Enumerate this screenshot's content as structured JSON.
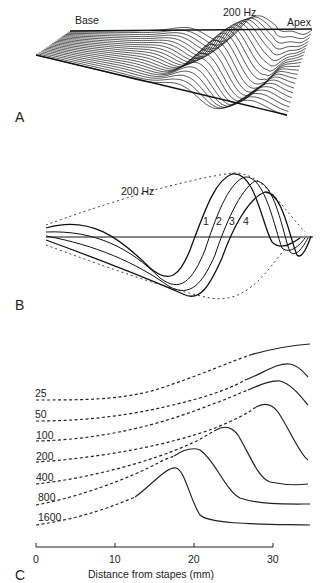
{
  "figure": {
    "panels": [
      {
        "letter": "A",
        "labels": {
          "left": "Base",
          "middle": "200 Hz",
          "right": "Apex"
        }
      },
      {
        "letter": "B",
        "labels": {
          "frequency": "200 Hz",
          "phases": [
            "1",
            "2",
            "3",
            "4"
          ]
        }
      },
      {
        "letter": "C",
        "curve_labels": [
          "25",
          "50",
          "100",
          "200",
          "400",
          "800",
          "1600"
        ]
      }
    ]
  },
  "chart_data": [
    {
      "panel": "A",
      "type": "line",
      "title": "Travelling wave on basilar membrane (3D stack)",
      "annotations": [
        "Base",
        "200 Hz",
        "Apex"
      ],
      "xlabel": "",
      "ylabel": "",
      "grid": false
    },
    {
      "panel": "B",
      "type": "line",
      "title": "200 Hz travelling wave at four instants with envelope",
      "series": [
        {
          "name": "1"
        },
        {
          "name": "2"
        },
        {
          "name": "3"
        },
        {
          "name": "4"
        },
        {
          "name": "envelope",
          "style": "dashed"
        }
      ],
      "annotations": [
        "200 Hz",
        "1",
        "2",
        "3",
        "4"
      ],
      "grid": false
    },
    {
      "panel": "C",
      "type": "line",
      "xlabel": "Distance from stapes (mm)",
      "ylabel": "",
      "xlim": [
        0,
        35
      ],
      "xticks": [
        "0",
        "10",
        "20",
        "30"
      ],
      "legend_position": "inline-left",
      "series": [
        {
          "name": "25",
          "peak_mm": 33
        },
        {
          "name": "50",
          "peak_mm": 32
        },
        {
          "name": "100",
          "peak_mm": 31
        },
        {
          "name": "200",
          "peak_mm": 29
        },
        {
          "name": "400",
          "peak_mm": 24
        },
        {
          "name": "800",
          "peak_mm": 20
        },
        {
          "name": "1600",
          "peak_mm": 18
        }
      ]
    }
  ],
  "axis": {
    "ticks": [
      "0",
      "10",
      "20",
      "30"
    ],
    "xlabel": "Distance from stapes (mm)"
  }
}
